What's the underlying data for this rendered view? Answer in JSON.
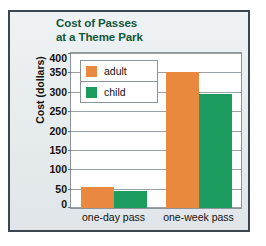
{
  "chart_data": {
    "type": "bar",
    "title": "Cost of Passes at a Theme Park",
    "title_line1": "Cost of Passes",
    "title_line2": "at a Theme Park",
    "xlabel": "",
    "ylabel": "Cost (dollars)",
    "categories": [
      "one-day pass",
      "one-week pass"
    ],
    "series": [
      {
        "name": "adult",
        "color": "#e8893f",
        "values": [
          55,
          350
        ]
      },
      {
        "name": "child",
        "color": "#1b9b5e",
        "values": [
          44,
          295
        ]
      }
    ],
    "ylim": [
      0,
      400
    ],
    "ytick_step": 50,
    "yticks": [
      400,
      350,
      300,
      250,
      200,
      150,
      100,
      50,
      0
    ],
    "grid": true,
    "legend_position": "inside-top-left"
  },
  "legend": {
    "items": [
      {
        "label": "adult",
        "color": "#e8893f"
      },
      {
        "label": "child",
        "color": "#1b9b5e"
      }
    ]
  },
  "colors": {
    "adult": "#e8893f",
    "child": "#1b9b5e",
    "title": "#12563a",
    "frame": "#3a4750",
    "panel": "#e9eef0",
    "plot_bg": "#ffffff",
    "gridline": "#9aa1a6"
  }
}
